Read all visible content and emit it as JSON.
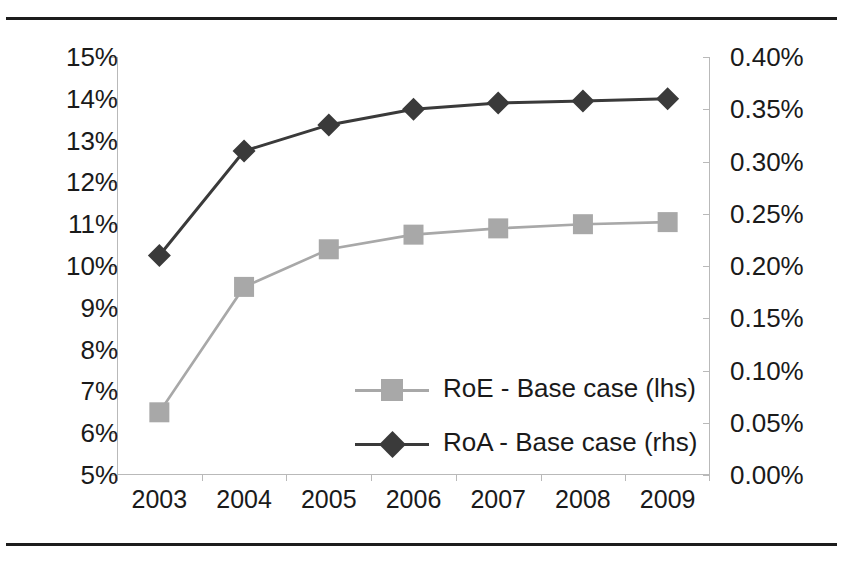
{
  "chart_data": {
    "type": "line",
    "title": "",
    "xlabel": "",
    "categories": [
      "2003",
      "2004",
      "2005",
      "2006",
      "2007",
      "2008",
      "2009"
    ],
    "series": [
      {
        "name": "RoE - Base case (lhs)",
        "axis": "left",
        "marker": "square",
        "color": "#a8a8a8",
        "values": [
          6.5,
          9.5,
          10.4,
          10.75,
          10.9,
          11.0,
          11.05
        ],
        "value_labels": [
          "6.5%",
          "9.5%",
          "10.4%",
          "10.75%",
          "10.9%",
          "11.0%",
          "11.05%"
        ]
      },
      {
        "name": "RoA - Base case (rhs)",
        "axis": "right",
        "marker": "diamond",
        "color": "#3a3a3a",
        "values": [
          0.21,
          0.31,
          0.335,
          0.35,
          0.356,
          0.358,
          0.36
        ],
        "value_labels": [
          "0.21%",
          "0.31%",
          "0.335%",
          "0.35%",
          "0.356%",
          "0.358%",
          "0.36%"
        ]
      }
    ],
    "left_axis": {
      "label": "",
      "ylim": [
        5,
        15
      ],
      "tick_step": 1,
      "ticks": [
        "15%",
        "14%",
        "13%",
        "12%",
        "11%",
        "10%",
        "9%",
        "8%",
        "7%",
        "6%",
        "5%"
      ]
    },
    "right_axis": {
      "label": "",
      "ylim": [
        0.0,
        0.4
      ],
      "tick_step": 0.05,
      "ticks": [
        "0.40%",
        "0.35%",
        "0.30%",
        "0.25%",
        "0.20%",
        "0.15%",
        "0.10%",
        "0.05%",
        "0.00%"
      ]
    },
    "legend": {
      "position": "center",
      "entries": [
        {
          "label": "RoE - Base case (lhs)",
          "marker": "square",
          "color": "#a8a8a8"
        },
        {
          "label": "RoA - Base case (rhs)",
          "marker": "diamond",
          "color": "#3a3a3a"
        }
      ]
    },
    "grid": false
  }
}
